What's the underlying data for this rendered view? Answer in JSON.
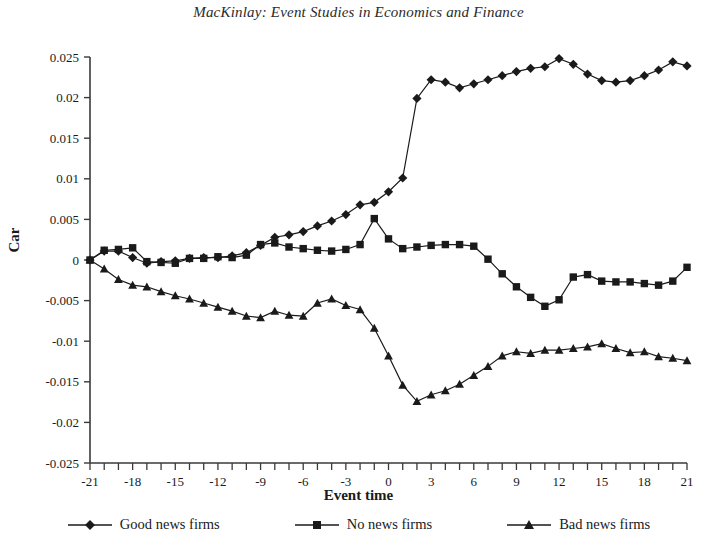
{
  "chart_data": {
    "type": "line",
    "title": "MacKinlay: Event Studies in Economics and Finance",
    "xlabel": "Event time",
    "ylabel": "Car",
    "xlim": [
      -21,
      21
    ],
    "ylim": [
      -0.025,
      0.025
    ],
    "ytick_step": 0.005,
    "xtick_step": 1,
    "xtick_label_step": 3,
    "grid": false,
    "legend_position": "bottom",
    "x": [
      -21,
      -20,
      -19,
      -18,
      -17,
      -16,
      -15,
      -14,
      -13,
      -12,
      -11,
      -10,
      -9,
      -8,
      -7,
      -6,
      -5,
      -4,
      -3,
      -2,
      -1,
      0,
      1,
      2,
      3,
      4,
      5,
      6,
      7,
      8,
      9,
      10,
      11,
      12,
      13,
      14,
      15,
      16,
      17,
      18,
      19,
      20,
      21
    ],
    "xticklabels": [
      "-21",
      "-18",
      "-15",
      "-12",
      "-9",
      "-6",
      "-3",
      "0",
      "3",
      "6",
      "9",
      "12",
      "15",
      "18",
      "21"
    ],
    "yticklabels": [
      "0.025",
      "0.02",
      "0.015",
      "0.01",
      "0.005",
      "0",
      "-0.005",
      "-0.01",
      "-0.015",
      "-0.02",
      "-0.025"
    ],
    "series": [
      {
        "name": "Good news firms",
        "marker": "diamond",
        "color": "#1a1a1a",
        "values": [
          0,
          0.0011,
          0.0011,
          0.0003,
          -0.0004,
          -0.0002,
          -0.0001,
          0.0002,
          0.0003,
          0.0003,
          0.0005,
          0.0009,
          0.0018,
          0.0028,
          0.0031,
          0.0035,
          0.0042,
          0.0048,
          0.0056,
          0.0068,
          0.0071,
          0.0084,
          0.0101,
          0.0199,
          0.0222,
          0.0219,
          0.0212,
          0.0217,
          0.0222,
          0.0227,
          0.0232,
          0.0236,
          0.0238,
          0.0248,
          0.0241,
          0.0229,
          0.0221,
          0.0219,
          0.0221,
          0.0227,
          0.0234,
          0.0244,
          0.0239
        ]
      },
      {
        "name": "No news firms",
        "marker": "square",
        "color": "#1a1a1a",
        "values": [
          0,
          0.0012,
          0.0013,
          0.0015,
          -0.0002,
          -0.0003,
          -0.0004,
          0.0002,
          0.0002,
          0.0004,
          0.0003,
          0.0006,
          0.0019,
          0.0021,
          0.0016,
          0.0014,
          0.0012,
          0.0011,
          0.0013,
          0.0019,
          0.0051,
          0.0026,
          0.0014,
          0.0016,
          0.0018,
          0.0019,
          0.0019,
          0.0017,
          0.0001,
          -0.0017,
          -0.0033,
          -0.0046,
          -0.0057,
          -0.0049,
          -0.0021,
          -0.0018,
          -0.0026,
          -0.0027,
          -0.0027,
          -0.0029,
          -0.0031,
          -0.0026,
          -0.0009
        ]
      },
      {
        "name": "Bad news firms",
        "marker": "triangle",
        "color": "#1a1a1a",
        "values": [
          0,
          -0.0011,
          -0.0024,
          -0.0031,
          -0.0033,
          -0.0039,
          -0.0044,
          -0.0048,
          -0.0053,
          -0.0058,
          -0.0063,
          -0.0069,
          -0.0071,
          -0.0063,
          -0.0068,
          -0.0069,
          -0.0053,
          -0.0048,
          -0.0056,
          -0.0061,
          -0.0084,
          -0.0118,
          -0.0154,
          -0.0174,
          -0.0166,
          -0.0161,
          -0.0153,
          -0.0142,
          -0.0131,
          -0.0118,
          -0.0113,
          -0.0115,
          -0.0111,
          -0.0111,
          -0.0109,
          -0.0107,
          -0.0103,
          -0.0109,
          -0.0114,
          -0.0113,
          -0.0119,
          -0.0121,
          -0.0124
        ]
      }
    ]
  }
}
